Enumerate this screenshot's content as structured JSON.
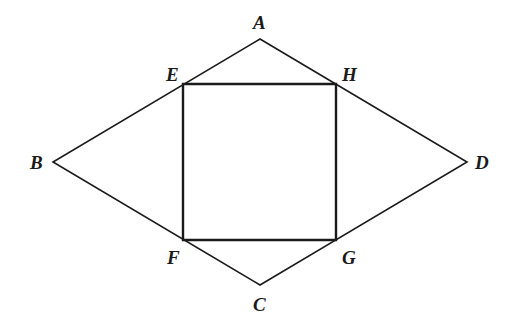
{
  "diagram": {
    "type": "geometry",
    "colors": {
      "stroke": "#1a1a1a",
      "background": "#ffffff"
    },
    "points": {
      "A": {
        "label": "A",
        "x": 260,
        "y": 39
      },
      "B": {
        "label": "B",
        "x": 53,
        "y": 162
      },
      "C": {
        "label": "C",
        "x": 260,
        "y": 285
      },
      "D": {
        "label": "D",
        "x": 467,
        "y": 162
      },
      "E": {
        "label": "E",
        "x": 183,
        "y": 84
      },
      "F": {
        "label": "F",
        "x": 183,
        "y": 240
      },
      "G": {
        "label": "G",
        "x": 336,
        "y": 240
      },
      "H": {
        "label": "H",
        "x": 336,
        "y": 84
      }
    },
    "shapes": [
      {
        "name": "rhombus",
        "vertices": [
          "A",
          "B",
          "C",
          "D"
        ]
      },
      {
        "name": "rectangle",
        "vertices": [
          "E",
          "F",
          "G",
          "H"
        ]
      }
    ]
  }
}
